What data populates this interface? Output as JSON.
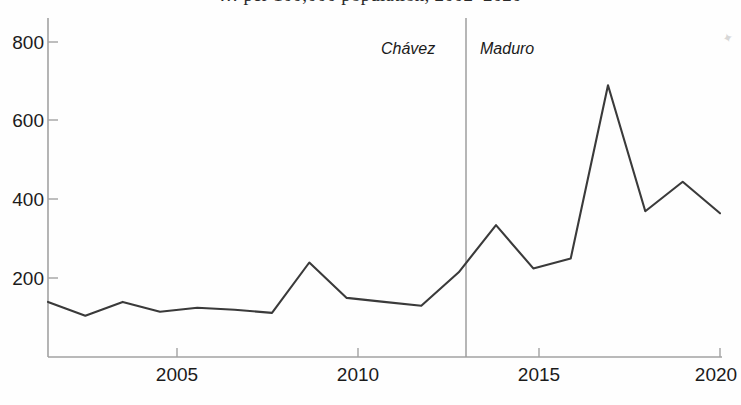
{
  "chart_data": {
    "type": "line",
    "title": "…  per 100,000 population, 2002–2020",
    "xlabel": "",
    "ylabel": "",
    "x": [
      2002,
      2003,
      2004,
      2005,
      2006,
      2007,
      2008,
      2009,
      2010,
      2011,
      2012,
      2013,
      2014,
      2015,
      2016,
      2017,
      2018,
      2019,
      2020
    ],
    "values": [
      140,
      105,
      140,
      115,
      125,
      120,
      112,
      240,
      150,
      140,
      130,
      215,
      335,
      225,
      250,
      690,
      370,
      445,
      365
    ],
    "series": [
      {
        "name": "rate",
        "values": [
          140,
          105,
          140,
          115,
          125,
          120,
          112,
          240,
          150,
          140,
          130,
          215,
          335,
          225,
          250,
          690,
          370,
          445,
          365
        ]
      }
    ],
    "xlim": [
      2002,
      2020
    ],
    "ylim": [
      0,
      860
    ],
    "x_ticks": [
      2005,
      2010,
      2015,
      2020
    ],
    "x_tick_labels": [
      "2005",
      "2010",
      "2015",
      "2020"
    ],
    "y_ticks": [
      200,
      400,
      600,
      800
    ],
    "y_tick_labels": [
      "200",
      "400",
      "600",
      "800"
    ],
    "grid": false,
    "legend": "none",
    "line_color": "#3a3a3a",
    "axis_color": "#9a9a9a",
    "annotations": [
      {
        "name": "era-divider",
        "type": "vline",
        "x": 2013,
        "color": "#9a9a9a"
      },
      {
        "name": "chavez-label",
        "type": "text",
        "text": "Chávez",
        "x": 2011.6,
        "y": 790
      },
      {
        "name": "maduro-label",
        "type": "text",
        "text": "Maduro",
        "x": 2013.5,
        "y": 790
      }
    ]
  },
  "axes": {
    "y_labels": [
      "800",
      "600",
      "400",
      "200"
    ],
    "x_labels": [
      "2005",
      "2010",
      "2015",
      "2020"
    ]
  },
  "annotations": {
    "chavez": "Chávez",
    "maduro": "Maduro"
  },
  "marks": {
    "corner_smudge": "✦"
  }
}
